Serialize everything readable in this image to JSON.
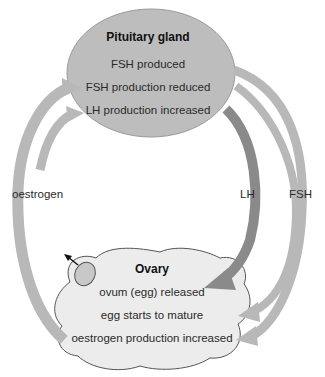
{
  "pituitary": {
    "title": "Pituitary gland",
    "lines": [
      "FSH produced",
      "FSH production reduced",
      "LH production increased"
    ]
  },
  "ovary": {
    "title": "Ovary",
    "lines": [
      "ovum (egg) released",
      "egg starts to mature",
      "oestrogen production increased"
    ]
  },
  "arrows": {
    "oestrogen": "oestrogen",
    "lh": "LH",
    "fsh": "FSH"
  },
  "colors": {
    "pituitary_fill": "#bdbdbd",
    "ovary_fill": "#ececec",
    "light_arrow": "#b8b8b8",
    "dark_arrow": "#8a8a8a"
  }
}
